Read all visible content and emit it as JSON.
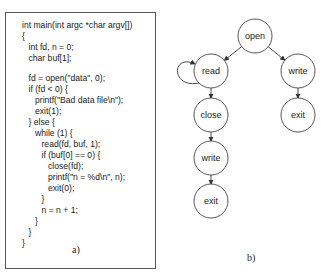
{
  "panel_a": {
    "caption": "a)",
    "code_lines": [
      {
        "text": "int main(int argc *char argv[])",
        "indent": 0,
        "y": 20
      },
      {
        "text": "{",
        "indent": 0,
        "y": 31
      },
      {
        "text": "int fd, n = 0;",
        "indent": 1,
        "y": 42
      },
      {
        "text": "char buf[1];",
        "indent": 1,
        "y": 53
      },
      {
        "text": "fd = open(\"data\", 0);",
        "indent": 1,
        "y": 73
      },
      {
        "text": "if (fd < 0) {",
        "indent": 1,
        "y": 84
      },
      {
        "text": "printf(\"Bad data file\\n\");",
        "indent": 2,
        "y": 95
      },
      {
        "text": "exit(1);",
        "indent": 2,
        "y": 106
      },
      {
        "text": "} else {",
        "indent": 1,
        "y": 117
      },
      {
        "text": "while (1) {",
        "indent": 2,
        "y": 128
      },
      {
        "text": "read(fd, buf, 1);",
        "indent": 3,
        "y": 139
      },
      {
        "text": "if (buf[0] == 0) {",
        "indent": 3,
        "y": 150
      },
      {
        "text": "close(fd);",
        "indent": 4,
        "y": 161
      },
      {
        "text": "printf(\"n = %d\\n\", n);",
        "indent": 4,
        "y": 172
      },
      {
        "text": "exit(0);",
        "indent": 4,
        "y": 183
      },
      {
        "text": "}",
        "indent": 3,
        "y": 194
      },
      {
        "text": "n = n + 1;",
        "indent": 3,
        "y": 205
      },
      {
        "text": "}",
        "indent": 2,
        "y": 216
      },
      {
        "text": "}",
        "indent": 1,
        "y": 227
      },
      {
        "text": "}",
        "indent": 0,
        "y": 238
      }
    ]
  },
  "panel_b": {
    "caption": "b)",
    "nodes": [
      {
        "id": "open",
        "label": "open",
        "cx": 255,
        "cy": 36
      },
      {
        "id": "read",
        "label": "read",
        "cx": 211,
        "cy": 71
      },
      {
        "id": "write_r",
        "label": "write",
        "cx": 298,
        "cy": 71
      },
      {
        "id": "close",
        "label": "close",
        "cx": 211,
        "cy": 115
      },
      {
        "id": "exit_r",
        "label": "exit",
        "cx": 298,
        "cy": 115
      },
      {
        "id": "write_l",
        "label": "write",
        "cx": 211,
        "cy": 158
      },
      {
        "id": "exit_l",
        "label": "exit",
        "cx": 211,
        "cy": 201
      }
    ],
    "edges": [
      {
        "from": "open",
        "to": "read"
      },
      {
        "from": "open",
        "to": "write_r"
      },
      {
        "from": "read",
        "to": "read",
        "self_loop": true
      },
      {
        "from": "read",
        "to": "close"
      },
      {
        "from": "write_r",
        "to": "exit_r"
      },
      {
        "from": "close",
        "to": "write_l"
      },
      {
        "from": "write_l",
        "to": "exit_l"
      }
    ]
  }
}
